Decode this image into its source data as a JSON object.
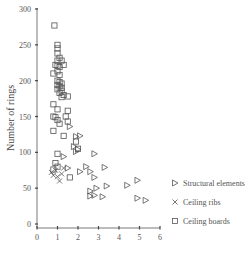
{
  "chart_data": {
    "type": "scatter",
    "title": "",
    "xlabel": "",
    "ylabel": "Number of rings",
    "xlim": [
      0,
      6
    ],
    "ylim": [
      0,
      300
    ],
    "xticks": [
      "0",
      "1",
      "2",
      "3",
      "4",
      "5",
      "6"
    ],
    "yticks": [
      "0",
      "50",
      "100",
      "150",
      "200",
      "250",
      "300"
    ],
    "grid": false,
    "legend_position": "right",
    "series": [
      {
        "name": "Structural elements",
        "marker": "triangle-right",
        "points": [
          [
            1.6,
            136
          ],
          [
            1.9,
            122
          ],
          [
            2.1,
            123
          ],
          [
            1.8,
            108
          ],
          [
            1.9,
            101
          ],
          [
            2.0,
            104
          ],
          [
            1.3,
            94
          ],
          [
            2.8,
            98
          ],
          [
            1.5,
            78
          ],
          [
            2.4,
            80
          ],
          [
            2.1,
            73
          ],
          [
            2.6,
            73
          ],
          [
            3.3,
            79
          ],
          [
            2.8,
            65
          ],
          [
            2.6,
            46
          ],
          [
            2.9,
            50
          ],
          [
            3.4,
            53
          ],
          [
            2.6,
            39
          ],
          [
            2.8,
            40
          ],
          [
            3.2,
            38
          ],
          [
            4.4,
            54
          ],
          [
            4.9,
            61
          ],
          [
            4.9,
            36
          ],
          [
            5.3,
            33
          ]
        ]
      },
      {
        "name": "Ceiling ribs",
        "marker": "x",
        "points": [
          [
            0.7,
            72
          ],
          [
            0.8,
            68
          ],
          [
            0.9,
            75
          ],
          [
            1.0,
            66
          ],
          [
            1.1,
            60
          ],
          [
            1.2,
            70
          ],
          [
            1.3,
            78
          ]
        ]
      },
      {
        "name": "Ceiling boards",
        "marker": "square",
        "points": [
          [
            0.85,
            277
          ],
          [
            1.0,
            250
          ],
          [
            1.0,
            245
          ],
          [
            1.0,
            238
          ],
          [
            1.1,
            232
          ],
          [
            1.0,
            228
          ],
          [
            1.2,
            228
          ],
          [
            0.9,
            222
          ],
          [
            1.0,
            221
          ],
          [
            1.1,
            219
          ],
          [
            1.3,
            222
          ],
          [
            1.0,
            213
          ],
          [
            0.8,
            210
          ],
          [
            1.1,
            208
          ],
          [
            1.0,
            200
          ],
          [
            1.1,
            198
          ],
          [
            1.2,
            196
          ],
          [
            1.0,
            194
          ],
          [
            1.1,
            192
          ],
          [
            1.2,
            190
          ],
          [
            1.0,
            188
          ],
          [
            1.2,
            186
          ],
          [
            1.1,
            183
          ],
          [
            1.3,
            180
          ],
          [
            1.2,
            177
          ],
          [
            1.5,
            178
          ],
          [
            0.8,
            167
          ],
          [
            1.0,
            160
          ],
          [
            1.5,
            158
          ],
          [
            0.8,
            150
          ],
          [
            0.9,
            149
          ],
          [
            1.4,
            150
          ],
          [
            1.0,
            145
          ],
          [
            1.5,
            143
          ],
          [
            1.1,
            140
          ],
          [
            0.8,
            130
          ],
          [
            1.3,
            123
          ],
          [
            1.9,
            115
          ],
          [
            2.0,
            105
          ],
          [
            1.0,
            98
          ],
          [
            0.9,
            85
          ],
          [
            1.0,
            80
          ],
          [
            1.6,
            65
          ],
          [
            0.8,
            76
          ]
        ]
      }
    ]
  }
}
